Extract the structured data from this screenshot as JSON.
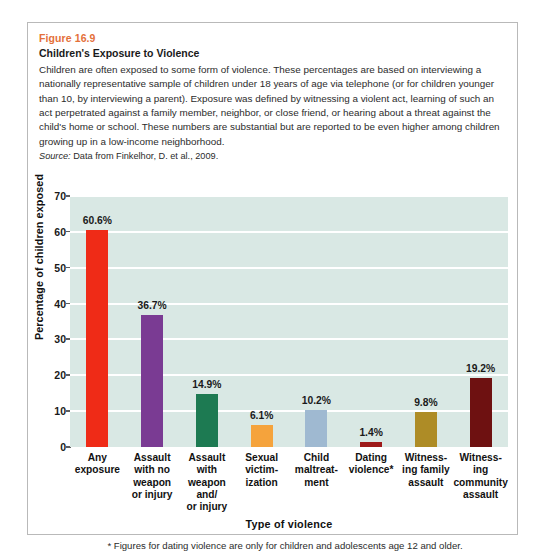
{
  "figure": {
    "number": "Figure 16.9",
    "title": "Children's Exposure to Violence",
    "body": "Children are often exposed to some form of violence. These percentages are based on interviewing a nationally representative sample of children under 18 years of age via telephone (or for children younger than 10, by interviewing a parent). Exposure was defined by witnessing a violent act, learning of such an act perpetrated against a family member, neighbor, or close friend, or hearing about a threat against the child's home or school. These numbers are substantial but are reported to be even higher among children growing up in a low-income neighborhood.",
    "source_label": "Source:",
    "source_text": " Data from Finkelhor, D. et al., 2009."
  },
  "footnote": "* Figures for dating violence are only for children and adolescents age 12 and older.",
  "chart_data": {
    "type": "bar",
    "title": "Children's Exposure to Violence",
    "xlabel": "Type of violence",
    "ylabel": "Percentage of children exposed",
    "ylim": [
      0,
      70
    ],
    "yticks": [
      0,
      10,
      20,
      30,
      40,
      50,
      60,
      70
    ],
    "ytick_labels": [
      "0",
      "10",
      "20",
      "30",
      "40",
      "50",
      "60",
      "70"
    ],
    "grid": true,
    "legend": "none",
    "plot_background": "#d9e8e4",
    "gridline_color": "#ffffff",
    "categories": [
      "Any exposure",
      "Assault with no weapon or injury",
      "Assault with weapon and/ or injury",
      "Sexual victim- ization",
      "Child maltreat- ment",
      "Dating violence*",
      "Witness- ing family assault",
      "Witness- ing community assault"
    ],
    "category_lines": [
      [
        "Any",
        "exposure"
      ],
      [
        "Assault",
        "with no",
        "weapon",
        "or injury"
      ],
      [
        "Assault",
        "with",
        "weapon",
        "and/",
        "or injury"
      ],
      [
        "Sexual",
        "victim-",
        "ization"
      ],
      [
        "Child",
        "maltreat-",
        "ment"
      ],
      [
        "Dating",
        "violence*"
      ],
      [
        "Witness-",
        "ing family",
        "assault"
      ],
      [
        "Witness-",
        "ing",
        "community",
        "assault"
      ]
    ],
    "values": [
      60.6,
      36.7,
      14.9,
      6.1,
      10.2,
      1.4,
      9.8,
      19.2
    ],
    "value_labels": [
      "60.6%",
      "36.7%",
      "14.9%",
      "6.1%",
      "10.2%",
      "1.4%",
      "9.8%",
      "19.2%"
    ],
    "colors": [
      "#ef2b17",
      "#7a3b93",
      "#1d7a52",
      "#f5a33c",
      "#9fb9d1",
      "#9e1a1a",
      "#ae8c26",
      "#6e1111"
    ]
  }
}
